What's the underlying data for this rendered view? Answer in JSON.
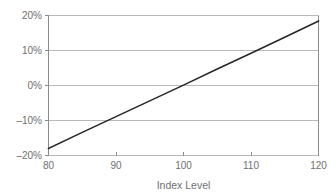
{
  "chart_data": {
    "type": "line",
    "title": "",
    "subtitle": "",
    "xlabel": "Index Level",
    "ylabel": "",
    "xlim": [
      80,
      120
    ],
    "ylim": [
      -0.2,
      0.2
    ],
    "grid": true,
    "legend": false,
    "legend_position": "none",
    "x_ticks": [
      80,
      90,
      100,
      110,
      120
    ],
    "x_tick_labels": [
      "80",
      "90",
      "100",
      "110",
      "120"
    ],
    "y_ticks": [
      -0.2,
      -0.1,
      0.0,
      0.1,
      0.2
    ],
    "y_tick_labels": [
      "–20%",
      "–10%",
      "0%",
      "10%",
      "20%"
    ],
    "series": [
      {
        "name": "Payoff",
        "color": "#262626",
        "x": [
          80,
          85,
          90,
          95,
          100,
          105,
          110,
          115,
          120
        ],
        "values": [
          -0.18,
          -0.134,
          -0.089,
          -0.044,
          0.001,
          0.047,
          0.092,
          0.138,
          0.184
        ]
      }
    ],
    "annotations": []
  },
  "axis_colors": {
    "gridline": "#b9b9b9",
    "frame": "#8a8a8a",
    "label_text": "#6f6f6f",
    "series": "#262626",
    "background": "#ffffff"
  }
}
